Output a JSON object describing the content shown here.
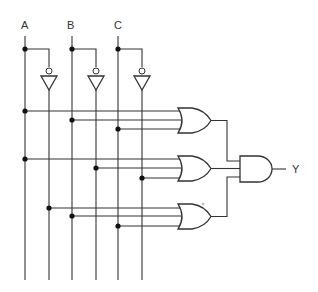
{
  "diagram": {
    "type": "logic-circuit",
    "inputs": [
      {
        "id": "A",
        "label": "A"
      },
      {
        "id": "B",
        "label": "B"
      },
      {
        "id": "C",
        "label": "C"
      }
    ],
    "output": {
      "id": "Y",
      "label": "Y"
    },
    "rails": [
      {
        "id": "A",
        "signal": "A"
      },
      {
        "id": "An",
        "signal": "NOT A"
      },
      {
        "id": "B",
        "signal": "B"
      },
      {
        "id": "Bn",
        "signal": "NOT B"
      },
      {
        "id": "C",
        "signal": "C"
      },
      {
        "id": "Cn",
        "signal": "NOT C"
      }
    ],
    "gates": [
      {
        "id": "not-a",
        "type": "NOT",
        "inputs": [
          "A"
        ],
        "output": "An"
      },
      {
        "id": "not-b",
        "type": "NOT",
        "inputs": [
          "B"
        ],
        "output": "Bn"
      },
      {
        "id": "not-c",
        "type": "NOT",
        "inputs": [
          "C"
        ],
        "output": "Cn"
      },
      {
        "id": "or-1",
        "type": "OR",
        "inputs": [
          "A",
          "B",
          "C"
        ]
      },
      {
        "id": "or-2",
        "type": "OR",
        "inputs": [
          "A",
          "Bn",
          "Cn"
        ]
      },
      {
        "id": "or-3",
        "type": "OR",
        "inputs": [
          "An",
          "B",
          "C"
        ]
      },
      {
        "id": "and-1",
        "type": "AND",
        "inputs": [
          "or-1",
          "or-2",
          "or-3"
        ],
        "output": "Y"
      }
    ],
    "expression": "Y = (A + B + C)(A + B' + C')(A' + B + C)"
  }
}
